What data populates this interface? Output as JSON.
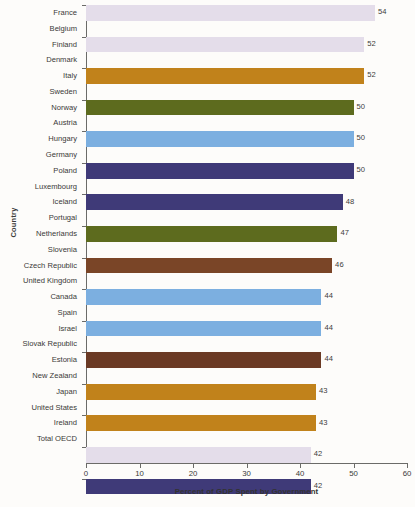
{
  "chart_data": {
    "type": "bar",
    "orientation": "horizontal",
    "title": "",
    "xlabel": "Percent of GDP Spent by Government",
    "ylabel": "Country",
    "xlim": [
      0,
      60
    ],
    "xticks": [
      0,
      10,
      20,
      30,
      40,
      50,
      60
    ],
    "grid": false,
    "legend": "none",
    "categories": [
      "France",
      "Belgium",
      "Finland",
      "Denmark",
      "Italy",
      "Sweden",
      "Norway",
      "Austria",
      "Hungary",
      "Germany",
      "Poland",
      "Luxembourg",
      "Iceland",
      "Portugal",
      "Netherlands",
      "Slovenia",
      "Czech Republic",
      "United Kingdom",
      "Canada",
      "Spain",
      "Israel",
      "Slovak Republic",
      "Estonia",
      "New Zealand",
      "Japan",
      "United States",
      "Ireland",
      "Total OECD"
    ],
    "values": [
      54,
      52,
      52,
      50,
      50,
      50,
      48,
      47,
      46,
      44,
      44,
      44,
      43,
      43,
      42,
      42,
      41,
      41,
      41,
      41,
      40,
      40,
      39,
      38,
      38,
      38,
      25,
      40
    ],
    "value_labels": [
      "54",
      "52",
      "52",
      "50",
      "50",
      "50",
      "48",
      "47",
      "46",
      "44",
      "44",
      "44",
      "43",
      "43",
      "42",
      "42",
      "41",
      "41",
      "41",
      "41",
      "40",
      "40",
      "39",
      "38",
      "38",
      "38",
      "25",
      "40"
    ],
    "bar_colors": [
      "#e4ddea",
      "#e4ddea",
      "#c1821b",
      "#5d6b1e",
      "#7cafe0",
      "#3f3a78",
      "#3f3a78",
      "#5d6b1e",
      "#7a4527",
      "#7cafe0",
      "#7cafe0",
      "#6b3a24",
      "#c1821b",
      "#c1821b",
      "#e4ddea",
      "#3f3a78",
      "#7a4527",
      "#5d6b1e",
      "#7cafe0",
      "#5d6b1e",
      "#3f3a78",
      "#c1821b",
      "#7a4527",
      "#e4ddea",
      "#5d6b1e",
      "#7cafe0",
      "#7a4527",
      "#4a4584"
    ],
    "palette": {
      "lavender": "#e4ddea",
      "ochre": "#c1821b",
      "olive": "#5d6b1e",
      "light-blue": "#7cafe0",
      "navy": "#3f3a78",
      "brown": "#7a4527",
      "total-navy": "#4a4584"
    },
    "axis_color": "#6b6b68",
    "text_color": "#3a3a38",
    "background": "#fdfcfa"
  }
}
